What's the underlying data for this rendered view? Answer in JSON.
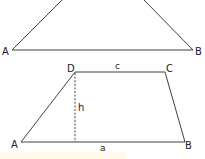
{
  "colors": {
    "stroke": "#2a2a2a",
    "background": "#ffffff",
    "highlight_strip": "#fffbe8"
  },
  "triangle": {
    "vertices": {
      "A": "A",
      "B": "B"
    }
  },
  "trapezoid": {
    "vertices": {
      "A": "A",
      "B": "B",
      "C": "C",
      "D": "D"
    },
    "sides": {
      "top": "c",
      "bottom": "a"
    },
    "height_label": "h"
  }
}
